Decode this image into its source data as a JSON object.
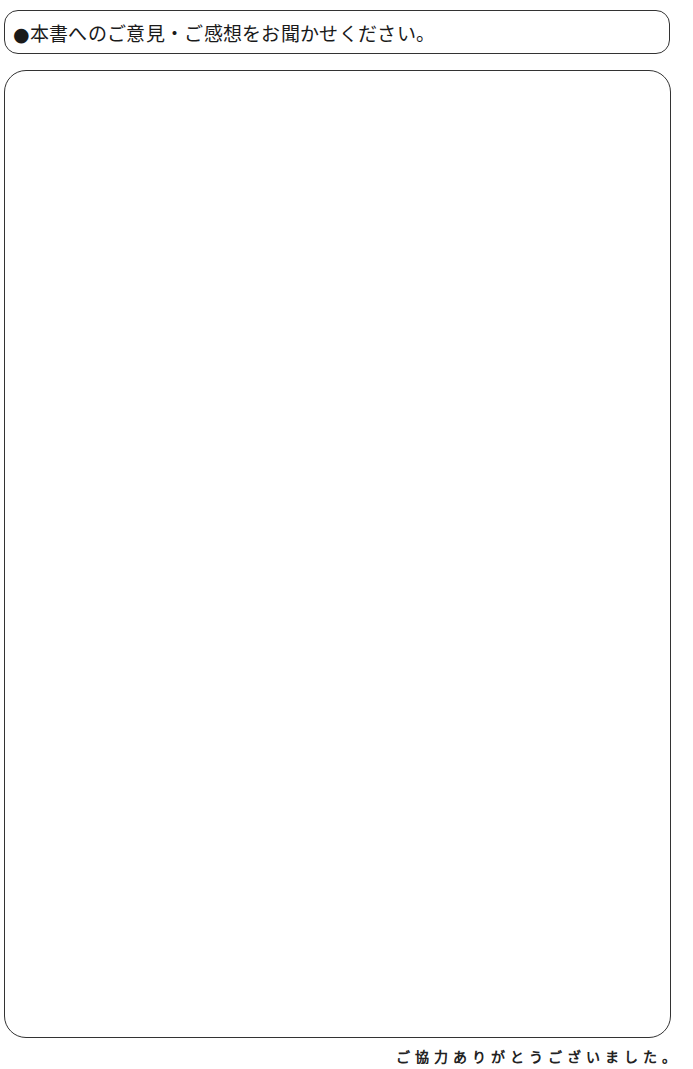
{
  "header": {
    "title": "●本書へのご意見・ご感想をお聞かせください。"
  },
  "comment_box": {
    "value": "",
    "placeholder": ""
  },
  "footer": {
    "thanks": "ご協力ありがとうございました。"
  },
  "colors": {
    "border": "#333333",
    "text": "#1a1a1a",
    "background": "#ffffff"
  }
}
